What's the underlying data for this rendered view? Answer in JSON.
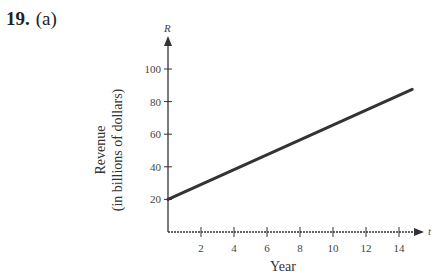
{
  "problem": {
    "number": "19.",
    "part": "(a)"
  },
  "chart_data": {
    "type": "line",
    "title": "",
    "xlabel": "Year",
    "ylabel": "Revenue",
    "ylabel_sub": "(in billions of dollars)",
    "x_var": "t",
    "y_var": "R",
    "x_ticks": [
      2,
      4,
      6,
      8,
      10,
      12,
      14
    ],
    "y_ticks": [
      20,
      40,
      60,
      80,
      100
    ],
    "xlim": [
      0,
      15.5
    ],
    "ylim": [
      0,
      110
    ],
    "grid": false,
    "legend": null,
    "series": [
      {
        "name": "Revenue",
        "x": [
          0,
          14.8
        ],
        "y": [
          20,
          87.5
        ],
        "color": "#333333"
      }
    ]
  }
}
